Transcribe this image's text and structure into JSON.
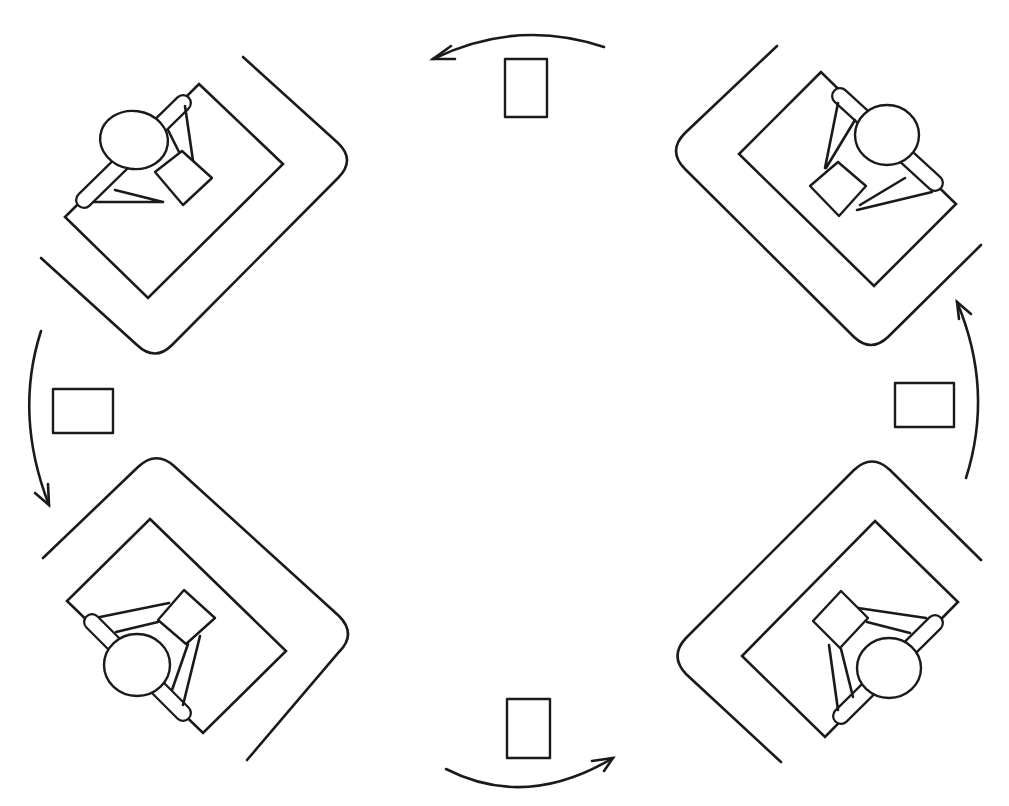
{
  "diagram": {
    "title": "Workstation rotation layout",
    "stroke_color": "#1a1a1a",
    "background_color": "#ffffff",
    "stations": [
      {
        "id": "top-left",
        "label": "Workstation top-left"
      },
      {
        "id": "top-right",
        "label": "Workstation top-right"
      },
      {
        "id": "bottom-left",
        "label": "Workstation bottom-left"
      },
      {
        "id": "bottom-right",
        "label": "Workstation bottom-right"
      }
    ],
    "markers": [
      {
        "id": "top",
        "label": "Marker top"
      },
      {
        "id": "left",
        "label": "Marker left"
      },
      {
        "id": "right",
        "label": "Marker right"
      },
      {
        "id": "bottom",
        "label": "Marker bottom"
      }
    ],
    "arrows": [
      {
        "id": "top",
        "direction": "leftward"
      },
      {
        "id": "left",
        "direction": "downward"
      },
      {
        "id": "right",
        "direction": "upward"
      },
      {
        "id": "bottom",
        "direction": "rightward"
      }
    ],
    "rotation": "clockwise"
  }
}
